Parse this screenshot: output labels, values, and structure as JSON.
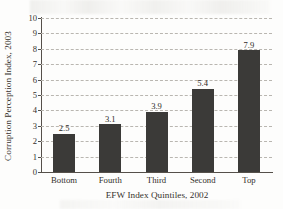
{
  "chart_data": {
    "type": "bar",
    "title": "",
    "categories": [
      "Bottom",
      "Fourth",
      "Third",
      "Second",
      "Top"
    ],
    "values": [
      2.5,
      3.1,
      3.9,
      5.4,
      7.9
    ],
    "value_labels": [
      "2.5",
      "3.1",
      "3.9",
      "5.4",
      "7.9"
    ],
    "xlabel": "EFW Index Quintiles, 2002",
    "ylabel": "Corruption Perception Index, 2003",
    "ylim": [
      0,
      10
    ],
    "ytick_step": 1,
    "ytick_labels": [
      "0",
      "1",
      "2",
      "3",
      "4",
      "5",
      "6",
      "7",
      "8",
      "9",
      "10"
    ],
    "grid": "horizontal-dashed",
    "legend": "none",
    "bar_color": "#3b3a38",
    "grid_color": "#b9b6b0",
    "axis_color": "#55504a",
    "background_color": "#fdfdfc"
  }
}
